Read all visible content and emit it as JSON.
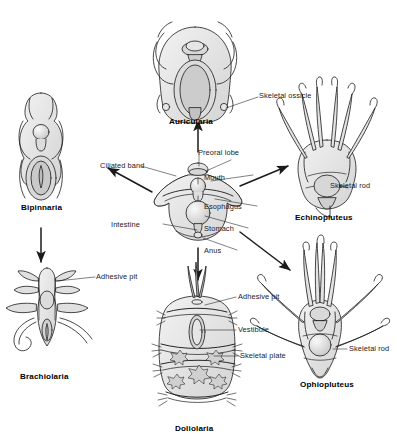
{
  "diagram": {
    "type": "echinoderm-larval-forms",
    "center": {
      "name": "generalized-dipleurula-larva",
      "labels": [
        {
          "key": "ciliated_band",
          "text": "Ciliated band"
        },
        {
          "key": "preoral_lobe",
          "text": "Preoral lobe"
        },
        {
          "key": "mouth",
          "text": "Mouth"
        },
        {
          "key": "esophagus",
          "text": "Esophagus"
        },
        {
          "key": "stomach",
          "text": "Stomach"
        },
        {
          "key": "intestine",
          "text": "Intestine"
        },
        {
          "key": "anus",
          "text": "Anus"
        }
      ]
    },
    "forms": [
      {
        "id": "auricularia",
        "name": "Auricularia",
        "position": "top",
        "labels": [
          {
            "key": "skeletal_ossicle",
            "text": "Skeletal ossicle"
          }
        ]
      },
      {
        "id": "bipinnaria",
        "name": "Bipinnaria",
        "position": "upper-left",
        "labels": []
      },
      {
        "id": "brachiolaria",
        "name": "Brachiolaria",
        "position": "lower-left",
        "labels": [
          {
            "key": "adhesive_pit",
            "text": "Adhesive pit"
          }
        ]
      },
      {
        "id": "echinopluteus",
        "name": "Echinopluteus",
        "position": "upper-right",
        "labels": [
          {
            "key": "skeletal_rod",
            "text": "Skeletal rod"
          }
        ]
      },
      {
        "id": "ophiopluteus",
        "name": "Ophiopluteus",
        "position": "lower-right",
        "labels": [
          {
            "key": "skeletal_rod",
            "text": "Skeletal rod"
          }
        ]
      },
      {
        "id": "doliolaria",
        "name": "Doliolaria",
        "position": "bottom",
        "labels": [
          {
            "key": "adhesive_pit",
            "text": "Adhesive pit"
          },
          {
            "key": "vestibule",
            "text": "Vestibule"
          },
          {
            "key": "skeletal_plate",
            "text": "Skeletal plate"
          }
        ]
      }
    ],
    "arrows": [
      {
        "from": "center",
        "to": "bipinnaria",
        "direction": "up-left"
      },
      {
        "from": "center",
        "to": "auricularia",
        "direction": "up"
      },
      {
        "from": "center",
        "to": "echinopluteus",
        "direction": "up-right"
      },
      {
        "from": "center",
        "to": "doliolaria",
        "direction": "down"
      },
      {
        "from": "center",
        "to": "ophiopluteus",
        "direction": "down-right"
      },
      {
        "from": "bipinnaria",
        "to": "brachiolaria",
        "direction": "down"
      }
    ],
    "colors": {
      "background": "#ffffff",
      "ink": "#1a1a1a",
      "fill_light": "#ececec",
      "fill_mid": "#dcdcdc",
      "fill_dark": "#c6c6c6"
    }
  }
}
